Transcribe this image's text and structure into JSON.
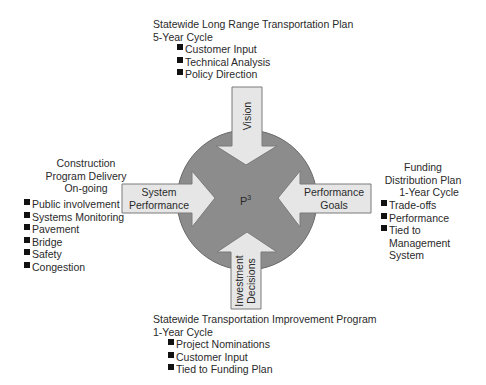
{
  "colors": {
    "circle_fill": "#8c8c8c",
    "circle_stroke": "#6a6a6a",
    "arrow_fill": "#e6e6e6",
    "arrow_stroke": "#7a7a7a",
    "bullet": "#111111",
    "text": "#2a2a2a"
  },
  "center": {
    "label": "P",
    "superscript": "3"
  },
  "arrows": {
    "top": {
      "label": "Vision",
      "direction": "down"
    },
    "left": {
      "line1": "System",
      "line2": "Performance",
      "direction": "right"
    },
    "right": {
      "line1": "Performance",
      "line2": "Goals",
      "direction": "left"
    },
    "bottom": {
      "line1": "Investment",
      "line2": "Decisions",
      "direction": "up"
    }
  },
  "top_block": {
    "title": "Statewide Long Range Transportation Plan",
    "cycle": "5-Year Cycle",
    "items": [
      "Customer Input",
      "Technical Analysis",
      "Policy Direction"
    ]
  },
  "left_block": {
    "title_lines": [
      "Construction",
      "Program Delivery",
      "On-going"
    ],
    "items": [
      "Public involvement",
      "Systems Monitoring",
      "Pavement",
      "Bridge",
      "Safety",
      "Congestion"
    ]
  },
  "right_block": {
    "title_lines": [
      "Funding",
      "Distribution Plan",
      "1-Year Cycle"
    ],
    "items": [
      "Trade-offs",
      "Performance",
      "Tied to",
      "Management",
      "System"
    ]
  },
  "bottom_block": {
    "title": "Statewide Transportation Improvement Program",
    "cycle": "1-Year Cycle",
    "items": [
      "Project Nominations",
      "Customer Input",
      "Tied to Funding Plan"
    ]
  }
}
